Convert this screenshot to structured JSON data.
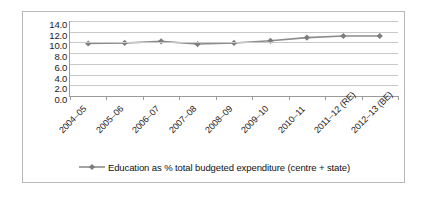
{
  "chart_data": {
    "type": "line",
    "title": "",
    "subtitle": "",
    "xlabel": "",
    "ylabel": "",
    "categories": [
      "2004–05",
      "2005–06",
      "2006–07",
      "2007–08",
      "2008–09",
      "2009–10",
      "2010–11",
      "2011–12 (RE)",
      "2012–13 (BE)"
    ],
    "series": [
      {
        "name": "Education as % total budgeted expenditure (centre + state)",
        "values": [
          9.8,
          9.9,
          10.2,
          9.7,
          9.9,
          10.3,
          10.9,
          11.2,
          11.2
        ],
        "color": "#8c8c8c",
        "marker": "diamond"
      }
    ],
    "ylim": [
      0.0,
      14.0
    ],
    "ytick_step": 2.0,
    "yticks": [
      "14.0",
      "12.0",
      "10.0",
      "8.0",
      "6.0",
      "4.0",
      "2.0",
      "0.0"
    ],
    "ytick_values": [
      14.0,
      12.0,
      10.0,
      8.0,
      6.0,
      4.0,
      2.0,
      0.0
    ],
    "grid": true,
    "grid_axis": "y",
    "legend_position": "bottom",
    "legend_entries": [
      "Education as % total budgeted expenditure (centre + state)"
    ],
    "annotations": []
  },
  "legend": {
    "label": "Education as % total budgeted expenditure (centre + state)"
  },
  "colors": {
    "series_line": "#8c8c8c",
    "series_marker": "#7d7d7d",
    "gridline": "#c9c9c9",
    "axis": "#9a9a9a",
    "frame_border": "#b8b8b8",
    "text": "#1a1a1a",
    "background": "#ffffff"
  }
}
